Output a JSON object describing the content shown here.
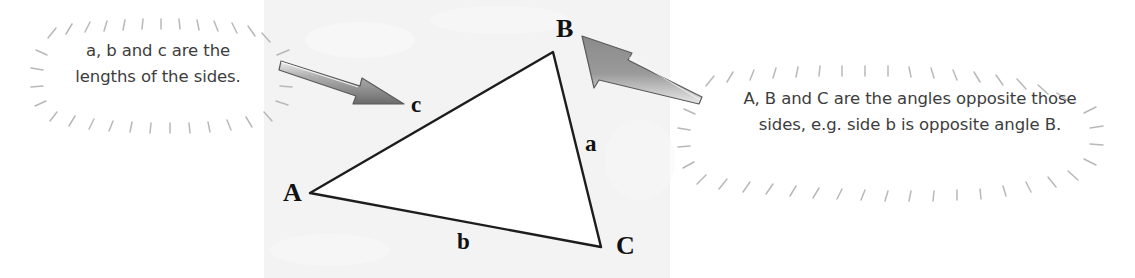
{
  "figure": {
    "panel": {
      "background_color": "#f3f3f3",
      "x": 264,
      "y": 0,
      "width": 406,
      "height": 278
    },
    "triangle": {
      "fill_color": "#ffffff",
      "stroke_color": "#1d1d1d",
      "vertices": {
        "A": {
          "x": 310,
          "y": 193
        },
        "B": {
          "x": 553,
          "y": 52
        },
        "C": {
          "x": 601,
          "y": 247
        }
      }
    },
    "vertex_labels": [
      {
        "text": "A",
        "x": 283,
        "y": 178
      },
      {
        "text": "B",
        "x": 556,
        "y": 14
      },
      {
        "text": "C",
        "x": 616,
        "y": 231
      }
    ],
    "side_labels": [
      {
        "text": "c",
        "x": 411,
        "y": 92
      },
      {
        "text": "a",
        "x": 585,
        "y": 131
      },
      {
        "text": "b",
        "x": 457,
        "y": 229
      }
    ]
  },
  "callouts": {
    "left": {
      "line1": "a, b and c are the",
      "line2": "lengths of the sides.",
      "text_color": "#3d3d3d",
      "burst_color": "#b8b8b8"
    },
    "right": {
      "line1": "A, B and C are the angles opposite those",
      "line2": "sides, e.g. side b is opposite angle B.",
      "text_color": "#3d3d3d",
      "burst_color": "#b8b8b8"
    }
  },
  "arrows": {
    "left": {
      "from_x": 281,
      "from_y": 64,
      "to_x": 404,
      "to_y": 104,
      "fill_light": "#d2d2d2",
      "fill_dark": "#6f6f6f",
      "outline": "#555555"
    },
    "right": {
      "from_x": 702,
      "from_y": 94,
      "to_x": 582,
      "to_y": 36,
      "fill_light": "#d2d2d2",
      "fill_dark": "#6f6f6f",
      "outline": "#555555"
    }
  }
}
